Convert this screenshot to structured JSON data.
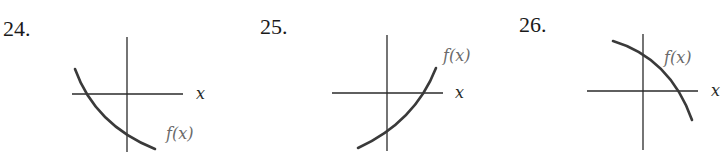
{
  "problems": [
    {
      "number": "24.",
      "x_axis_label": "x",
      "function_label": "f(x)",
      "description": "decreasing concave-up curve crossing x-axis left of origin and y-axis below origin"
    },
    {
      "number": "25.",
      "x_axis_label": "x",
      "function_label": "f(x)",
      "description": "increasing concave-up curve crossing y-axis below origin and x-axis right of origin"
    },
    {
      "number": "26.",
      "x_axis_label": "x",
      "function_label": "f(x)",
      "description": "decreasing concave-down curve crossing y-axis above origin and x-axis right of origin"
    }
  ],
  "colors": {
    "axis": "#2a2a2a",
    "curve": "#3a3a3a",
    "label": "#6a6a6a"
  }
}
